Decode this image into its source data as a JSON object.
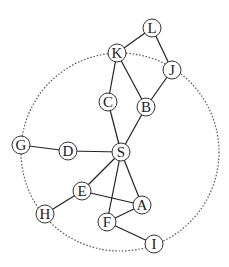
{
  "diagram": {
    "type": "graph",
    "boundary_circle": {
      "cx": 120,
      "cy": 152,
      "r": 99,
      "style": "dotted",
      "color": "#555555"
    },
    "node_radius": 9,
    "colors": {
      "edge": "#222222",
      "node_stroke": "#333333",
      "node_fill": "#ffffff",
      "label": "#222222"
    },
    "nodes": [
      {
        "id": "L",
        "label": "L",
        "x": 152,
        "y": 28
      },
      {
        "id": "K",
        "label": "K",
        "x": 117,
        "y": 53
      },
      {
        "id": "J",
        "label": "J",
        "x": 172,
        "y": 70
      },
      {
        "id": "C",
        "label": "C",
        "x": 108,
        "y": 102
      },
      {
        "id": "B",
        "label": "B",
        "x": 146,
        "y": 107
      },
      {
        "id": "G",
        "label": "G",
        "x": 21,
        "y": 145
      },
      {
        "id": "D",
        "label": "D",
        "x": 68,
        "y": 151
      },
      {
        "id": "S",
        "label": "S",
        "x": 121,
        "y": 152
      },
      {
        "id": "E",
        "label": "E",
        "x": 82,
        "y": 191
      },
      {
        "id": "A",
        "label": "A",
        "x": 142,
        "y": 205
      },
      {
        "id": "H",
        "label": "H",
        "x": 45,
        "y": 214
      },
      {
        "id": "F",
        "label": "F",
        "x": 107,
        "y": 222
      },
      {
        "id": "I",
        "label": "I",
        "x": 154,
        "y": 244
      }
    ],
    "edges": [
      [
        "L",
        "K"
      ],
      [
        "L",
        "J"
      ],
      [
        "K",
        "C"
      ],
      [
        "K",
        "B"
      ],
      [
        "J",
        "B"
      ],
      [
        "C",
        "S"
      ],
      [
        "B",
        "S"
      ],
      [
        "G",
        "D"
      ],
      [
        "D",
        "S"
      ],
      [
        "S",
        "E"
      ],
      [
        "S",
        "F"
      ],
      [
        "S",
        "A"
      ],
      [
        "E",
        "H"
      ],
      [
        "E",
        "A"
      ],
      [
        "A",
        "F"
      ],
      [
        "F",
        "I"
      ]
    ]
  }
}
